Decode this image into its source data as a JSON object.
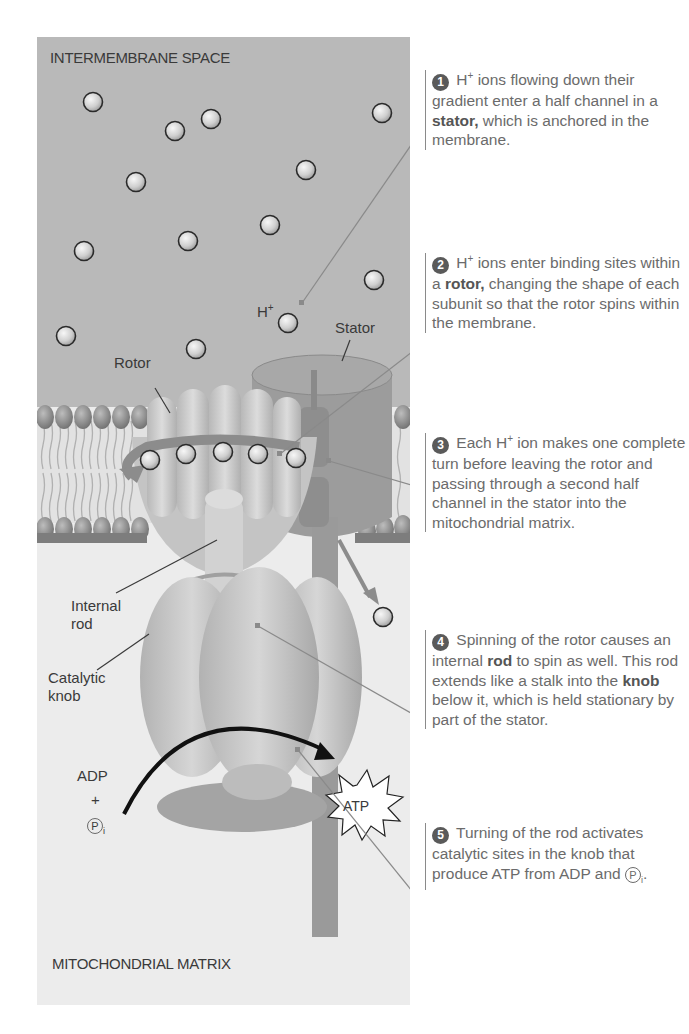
{
  "regions": {
    "top": "INTERMEMBRANE SPACE",
    "bottom": "MITOCHONDRIAL MATRIX"
  },
  "labels": {
    "h_plus": "H",
    "h_plus_sup": "+",
    "stator": "Stator",
    "rotor": "Rotor",
    "internal_rod_line1": "Internal",
    "internal_rod_line2": "rod",
    "catalytic_knob_line1": "Catalytic",
    "catalytic_knob_line2": "knob",
    "adp": "ADP",
    "plus": "+",
    "pi": "P",
    "pi_sub": "i",
    "atp": "ATP"
  },
  "callouts": [
    {
      "number": "1",
      "text_a": " H",
      "sup": "+",
      "text_b": " ions flowing down their gradient enter a half channel in a ",
      "bold": "stator,",
      "text_c": " which is anchored in the membrane."
    },
    {
      "number": "2",
      "text_a": " H",
      "sup": "+",
      "text_b": " ions enter binding sites within a ",
      "bold": "rotor,",
      "text_c": " changing the shape of each subunit so that the rotor spins within the membrane."
    },
    {
      "number": "3",
      "text_a": " Each H",
      "sup": "+",
      "text_b": " ion makes one complete turn before leaving the rotor and passing through a second half channel in the stator into the mitochondrial matrix."
    },
    {
      "number": "4",
      "text_a": " Spinning of the rotor causes an internal ",
      "bold1": "rod",
      "text_b": " to spin as well. This rod extends like a stalk into the ",
      "bold2": "knob",
      "text_c": " below it, which is held stationary by part of the stator."
    },
    {
      "number": "5",
      "text_a": " Turning of the rod activates catalytic sites in the knob that produce ATP from ADP and ",
      "pi": "P",
      "pi_sub": "i",
      "text_b": "."
    }
  ],
  "colors": {
    "intermembrane_bg": "#b9b9b9",
    "matrix_bg": "#ececec",
    "protein": "#c8c8c8",
    "stator": "#9c9c9c",
    "callout_text": "#6b6b6b",
    "number_badge": "#5a5a5a"
  }
}
